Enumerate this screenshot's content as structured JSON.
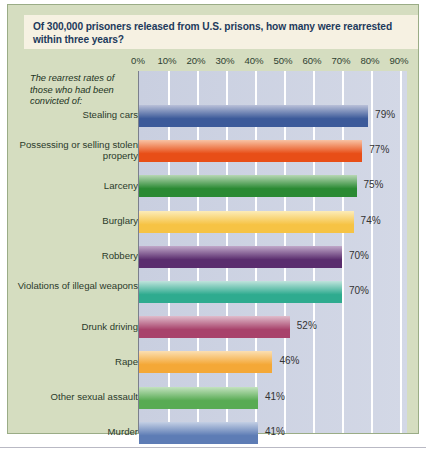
{
  "figure": {
    "title": "Of 300,000 prisoners released from U.S. prisons, how many were rearrested within three years?",
    "subtitle": "The rearrest rates of those who had been convicted of:",
    "panel_background": "#d5ddc0",
    "panel_border": "#9aac86",
    "title_background": "#f6f1e2",
    "title_color": "#1d3a5c",
    "plot_background": "#ccd2e2",
    "gridline_color": "#ffffff"
  },
  "chart_data": {
    "type": "bar",
    "orientation": "horizontal",
    "title": "Of 300,000 prisoners released from U.S. prisons, how many were rearrested within three years?",
    "subtitle": "The rearrest rates of those who had been convicted of:",
    "xlabel": "",
    "ylabel": "",
    "xlim": [
      0,
      95
    ],
    "grid": true,
    "legend": "none",
    "tick_labels": [
      "0%",
      "10%",
      "20%",
      "30%",
      "40%",
      "50%",
      "60%",
      "70%",
      "80%",
      "90%"
    ],
    "tick_values": [
      0,
      10,
      20,
      30,
      40,
      50,
      60,
      70,
      80,
      90
    ],
    "categories": [
      "Stealing cars",
      "Possessing or selling stolen property",
      "Larceny",
      "Burglary",
      "Robbery",
      "Violations of illegal weapons",
      "Drunk driving",
      "Rape",
      "Other sexual assault",
      "Murder"
    ],
    "values": [
      79,
      77,
      75,
      74,
      70,
      70,
      52,
      46,
      41,
      41
    ],
    "value_labels": [
      "79%",
      "77%",
      "75%",
      "74%",
      "70%",
      "70%",
      "52%",
      "46%",
      "41%",
      "41%"
    ],
    "bar_colors": [
      "#3c5a9a",
      "#e84e17",
      "#2a8a33",
      "#f6c344",
      "#5a2d6e",
      "#2eab8f",
      "#a8426b",
      "#f4a837",
      "#58ab53",
      "#5d7cb5"
    ],
    "bar_colors_light": [
      "#b9c0d8",
      "#f8c3a4",
      "#b7d7b4",
      "#fcecb8",
      "#c0a8c9",
      "#bfe3dc",
      "#e0bccb",
      "#fbdfb2",
      "#c3e2bf",
      "#c3cfe4"
    ]
  }
}
